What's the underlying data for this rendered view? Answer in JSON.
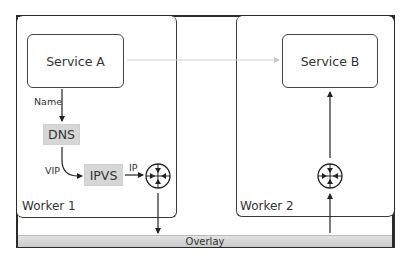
{
  "diagram": {
    "workers": [
      {
        "label": "Worker 1"
      },
      {
        "label": "Worker 2"
      }
    ],
    "services": [
      {
        "label": "Service A"
      },
      {
        "label": "Service B"
      }
    ],
    "components": {
      "dns": "DNS",
      "ipvs": "IPVS"
    },
    "edge_labels": {
      "name": "Name",
      "vip": "VIP",
      "ip": "IP"
    },
    "network": {
      "overlay": "Overlay"
    },
    "icons": {
      "router_1": "router-icon",
      "router_2": "router-icon"
    },
    "colors": {
      "frame": "#2a2a2a",
      "component_fill": "#d6d6d6",
      "overlay_fill": "#d4d4d4",
      "service_link": "#c8c8c8"
    }
  }
}
